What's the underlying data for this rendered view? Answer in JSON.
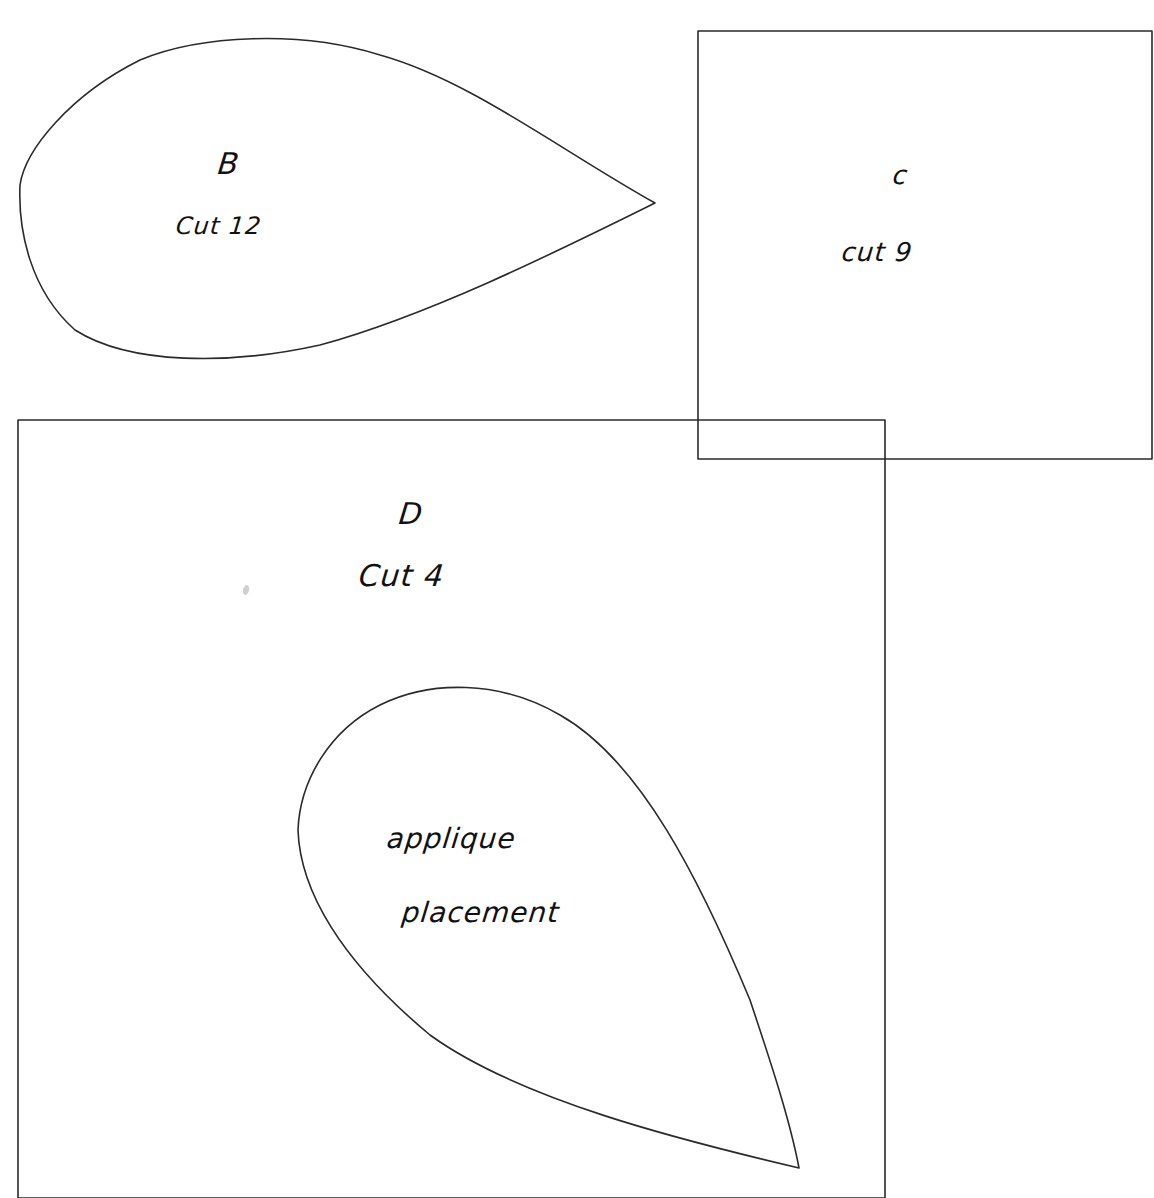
{
  "page": {
    "background": "#ffffff",
    "line_color": "#2a2a2a"
  },
  "pieces": [
    {
      "id": "B",
      "shape": "teardrop",
      "letter": "B",
      "instruction": "Cut 12",
      "path": "M 655 203 C 560 150, 470 80, 380 55 C 300 30, 200 35, 140 60 C 70 95, 25 150, 20 185 C 18 230, 30 290, 75 330 C 130 365, 230 365, 320 345 C 430 315, 560 250, 655 203 Z"
    },
    {
      "id": "C",
      "shape": "square",
      "letter": "C",
      "instruction": "cut 9",
      "rect": {
        "x1": 698,
        "y1": 31,
        "x2": 1152,
        "y2": 459
      }
    },
    {
      "id": "D",
      "shape": "square",
      "letter": "D",
      "instruction": "Cut 4",
      "rect": {
        "x1": 18,
        "y1": 420,
        "x2": 885,
        "y2": 1198
      }
    },
    {
      "id": "D-placement",
      "shape": "teardrop",
      "label_line1": "applique",
      "label_line2": "placement",
      "path": "M 799 1168 C 790 1120, 770 1060, 750 1000 C 700 880, 640 760, 560 715 C 500 680, 430 680, 380 705 C 330 730, 300 780, 298 830 C 300 890, 340 960, 430 1035 C 520 1100, 680 1140, 799 1168 Z"
    }
  ],
  "labels": {
    "b_letter": "B",
    "b_cut": "Cut 12",
    "c_letter": "c",
    "c_cut": "cut 9",
    "d_letter": "D",
    "d_cut": "Cut 4",
    "placement_line1": "applique",
    "placement_line2": "placement"
  }
}
